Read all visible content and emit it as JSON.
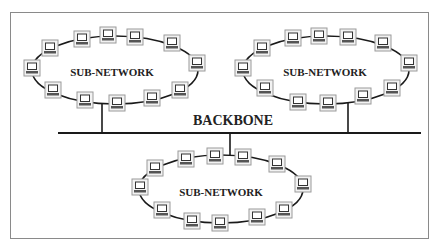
{
  "diagram": {
    "type": "network-topology",
    "backbone": {
      "label": "BACKBONE",
      "y": 133,
      "x1": 58,
      "x2": 421
    },
    "subnetworks": [
      {
        "label": "SUB-NETWORK",
        "label_pos": [
          112,
          72
        ],
        "ellipse": {
          "cx": 115,
          "cy": 70,
          "rx": 83,
          "ry": 34
        },
        "drop_x": 102,
        "nodes": [
          [
            50,
            48
          ],
          [
            82,
            39
          ],
          [
            108,
            35
          ],
          [
            135,
            37
          ],
          [
            172,
            43
          ],
          [
            197,
            63
          ],
          [
            180,
            90
          ],
          [
            152,
            98
          ],
          [
            117,
            103
          ],
          [
            85,
            100
          ],
          [
            53,
            90
          ],
          [
            32,
            68
          ]
        ]
      },
      {
        "label": "SUB-NETWORK",
        "label_pos": [
          325,
          72
        ],
        "ellipse": {
          "cx": 326,
          "cy": 70,
          "rx": 83,
          "ry": 34
        },
        "drop_x": 348,
        "nodes": [
          [
            262,
            48
          ],
          [
            293,
            38
          ],
          [
            319,
            36
          ],
          [
            348,
            37
          ],
          [
            383,
            43
          ],
          [
            409,
            63
          ],
          [
            392,
            88
          ],
          [
            363,
            96
          ],
          [
            328,
            103
          ],
          [
            298,
            102
          ],
          [
            265,
            88
          ],
          [
            243,
            68
          ]
        ]
      },
      {
        "label": "SUB-NETWORK",
        "label_pos": [
          221,
          192
        ],
        "ellipse": {
          "cx": 221,
          "cy": 189,
          "rx": 82,
          "ry": 34
        },
        "drop_x": 230,
        "nodes": [
          [
            155,
            168
          ],
          [
            186,
            159
          ],
          [
            215,
            156
          ],
          [
            243,
            157
          ],
          [
            277,
            164
          ],
          [
            303,
            184
          ],
          [
            284,
            210
          ],
          [
            257,
            217
          ],
          [
            220,
            223
          ],
          [
            192,
            221
          ],
          [
            162,
            210
          ],
          [
            140,
            187
          ]
        ]
      }
    ],
    "node_icon": "computer-terminal-icon",
    "colors": {
      "line": "#1a1a1a",
      "node_border": "#9a9a9a",
      "node_fill": "#f2f2f2",
      "frame": "#8a8a8a"
    }
  }
}
